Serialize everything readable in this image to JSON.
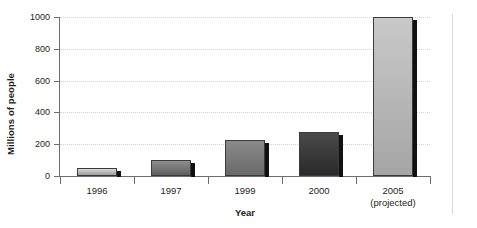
{
  "chart_data": {
    "type": "bar",
    "title": "",
    "subtitle": "",
    "xlabel": "Year",
    "ylabel": "Millions of people",
    "categories": [
      "1996",
      "1997",
      "1999",
      "2000",
      "2005"
    ],
    "category_sublabels": [
      "",
      "",
      "",
      "",
      "(projected)"
    ],
    "values": [
      50,
      100,
      225,
      275,
      1000
    ],
    "ylim": [
      0,
      1000
    ],
    "yticks": [
      0,
      200,
      400,
      600,
      800,
      1000
    ],
    "ytick_labels": [
      "0",
      "200",
      "400",
      "600",
      "800",
      "1000"
    ],
    "grid": true,
    "grid_style": "dotted-horizontal",
    "legend": "none",
    "bar_styles": [
      {
        "fill_top": "#d9d9d9",
        "fill_bottom": "#9a9a9a",
        "shadow": "#111111"
      },
      {
        "fill_top": "#8e8e8e",
        "fill_bottom": "#5e5e5e",
        "shadow": "#111111"
      },
      {
        "fill_top": "#8a8a8a",
        "fill_bottom": "#6a6a6a",
        "shadow": "#111111"
      },
      {
        "fill_top": "#4a4a4a",
        "fill_bottom": "#2a2a2a",
        "shadow": "#111111"
      },
      {
        "fill_top": "#c9c9c9",
        "fill_bottom": "#a5a5a5",
        "shadow": "#111111"
      }
    ],
    "colors": {
      "axis": "#6d6e71",
      "gridline": "#d2d2d2",
      "text": "#231f20",
      "right_rule": "#d8d8d8"
    }
  }
}
